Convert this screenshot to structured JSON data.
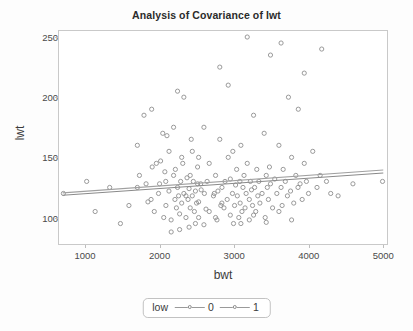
{
  "chart_data": {
    "type": "scatter",
    "title": "Analysis of Covariance of lwt",
    "xlabel": "bwt",
    "ylabel": "lwt",
    "xlim": [
      650,
      5050
    ],
    "ylim": [
      78,
      255
    ],
    "xticks": [
      1000,
      2000,
      3000,
      4000,
      5000
    ],
    "yticks": [
      100,
      150,
      200,
      250
    ],
    "grid": false,
    "legend": {
      "title": "low",
      "position": "bottom",
      "entries": [
        {
          "label": "0",
          "color": "#8d8d8d",
          "marker": "open-circle"
        },
        {
          "label": "1",
          "color": "#8d8d8d",
          "marker": "open-circle"
        }
      ]
    },
    "marker_style": {
      "shape": "open-circle",
      "radius": 2.1,
      "stroke": "#8f8f8f",
      "fill": "none"
    },
    "fit_lines": [
      {
        "name": "low = 0",
        "x": [
          700,
          5000
        ],
        "y": [
          118.5,
          137.0
        ],
        "color": "#8a8a8a"
      },
      {
        "name": "low = 1",
        "x": [
          700,
          5000
        ],
        "y": [
          120.5,
          139.5
        ],
        "color": "#a0a0a0"
      }
    ],
    "series": [
      {
        "name": "low = 0",
        "points": [
          [
            2523,
            113
          ],
          [
            2551,
            128
          ],
          [
            2557,
            123
          ],
          [
            2594,
            94
          ],
          [
            2600,
            120
          ],
          [
            2622,
            107
          ],
          [
            2637,
            130
          ],
          [
            2665,
            105
          ],
          [
            2722,
            118
          ],
          [
            2733,
            120
          ],
          [
            2750,
            135
          ],
          [
            2769,
            98
          ],
          [
            2782,
            122
          ],
          [
            2807,
            165
          ],
          [
            2821,
            110
          ],
          [
            2835,
            112
          ],
          [
            2836,
            125
          ],
          [
            2863,
            108
          ],
          [
            2877,
            130
          ],
          [
            2906,
            115
          ],
          [
            2920,
            150
          ],
          [
            2948,
            102
          ],
          [
            2948,
            132
          ],
          [
            2977,
            120
          ],
          [
            2982,
            155
          ],
          [
            2991,
            95
          ],
          [
            3005,
            110
          ],
          [
            3019,
            127
          ],
          [
            3033,
            140
          ],
          [
            3042,
            118
          ],
          [
            3062,
            100
          ],
          [
            3076,
            130
          ],
          [
            3080,
            112
          ],
          [
            3090,
            160
          ],
          [
            3104,
            105
          ],
          [
            3118,
            125
          ],
          [
            3132,
            135
          ],
          [
            3146,
            108
          ],
          [
            3160,
            120
          ],
          [
            3175,
            145
          ],
          [
            3203,
            115
          ],
          [
            3203,
            98
          ],
          [
            3217,
            130
          ],
          [
            3232,
            123
          ],
          [
            3246,
            110
          ],
          [
            3260,
            185
          ],
          [
            3274,
            125
          ],
          [
            3289,
            105
          ],
          [
            3303,
            140
          ],
          [
            3317,
            118
          ],
          [
            3331,
            130
          ],
          [
            3345,
            112
          ],
          [
            3374,
            120
          ],
          [
            3402,
            170
          ],
          [
            3416,
            100
          ],
          [
            3430,
            135
          ],
          [
            3444,
            125
          ],
          [
            3459,
            115
          ],
          [
            3473,
            142
          ],
          [
            3487,
            128
          ],
          [
            3515,
            108
          ],
          [
            3544,
            132
          ],
          [
            3572,
            120
          ],
          [
            3600,
            160
          ],
          [
            3629,
            125
          ],
          [
            3643,
            110
          ],
          [
            3657,
            140
          ],
          [
            3686,
            130
          ],
          [
            3714,
            118
          ],
          [
            3728,
            200
          ],
          [
            3756,
            122
          ],
          [
            3770,
            150
          ],
          [
            3799,
            112
          ],
          [
            3827,
            135
          ],
          [
            3856,
            125
          ],
          [
            3860,
            190
          ],
          [
            3884,
            128
          ],
          [
            3912,
            115
          ],
          [
            3940,
            145
          ],
          [
            3969,
            130
          ],
          [
            3997,
            120
          ],
          [
            4054,
            155
          ],
          [
            4111,
            125
          ],
          [
            4153,
            135
          ],
          [
            4174,
            240
          ],
          [
            4238,
            130
          ],
          [
            4295,
            120
          ],
          [
            4394,
            118
          ],
          [
            4593,
            128
          ],
          [
            4990,
            130
          ],
          [
            2523,
            150
          ],
          [
            2594,
            175
          ],
          [
            2665,
            145
          ],
          [
            2750,
            100
          ],
          [
            2920,
            210
          ],
          [
            3090,
            95
          ],
          [
            3260,
            102
          ],
          [
            3430,
            96
          ],
          [
            3600,
            105
          ],
          [
            3770,
            98
          ],
          [
            2807,
            225
          ],
          [
            3175,
            250
          ],
          [
            3487,
            235
          ],
          [
            3940,
            220
          ],
          [
            3629,
            245
          ]
        ]
      },
      {
        "name": "low = 1",
        "points": [
          [
            709,
            120
          ],
          [
            1021,
            130
          ],
          [
            1135,
            105
          ],
          [
            1330,
            125
          ],
          [
            1474,
            95
          ],
          [
            1588,
            110
          ],
          [
            1701,
            160
          ],
          [
            1729,
            135
          ],
          [
            1790,
            185
          ],
          [
            1818,
            128
          ],
          [
            1885,
            115
          ],
          [
            1893,
            190
          ],
          [
            1928,
            105
          ],
          [
            1985,
            120
          ],
          [
            2013,
            147
          ],
          [
            2055,
            100
          ],
          [
            2082,
            130
          ],
          [
            2084,
            110
          ],
          [
            2125,
            122
          ],
          [
            2126,
            155
          ],
          [
            2154,
            98
          ],
          [
            2187,
            135
          ],
          [
            2205,
            115
          ],
          [
            2211,
            140
          ],
          [
            2225,
            108
          ],
          [
            2240,
            125
          ],
          [
            2254,
            118
          ],
          [
            2268,
            103
          ],
          [
            2282,
            130
          ],
          [
            2296,
            112
          ],
          [
            2310,
            145
          ],
          [
            2325,
            120
          ],
          [
            2353,
            100
          ],
          [
            2367,
            133
          ],
          [
            2381,
            115
          ],
          [
            2395,
            124
          ],
          [
            2410,
            108
          ],
          [
            2424,
            165
          ],
          [
            2438,
            118
          ],
          [
            2452,
            130
          ],
          [
            2466,
            105
          ],
          [
            2480,
            122
          ],
          [
            2495,
            112
          ],
          [
            2509,
            128
          ],
          [
            2523,
            100
          ],
          [
            2187,
            175
          ],
          [
            2325,
            200
          ],
          [
            2438,
            155
          ],
          [
            2098,
            168
          ],
          [
            1956,
            145
          ],
          [
            2268,
            90
          ],
          [
            2395,
            92
          ],
          [
            2155,
            88
          ],
          [
            2480,
            95
          ],
          [
            2042,
            170
          ],
          [
            1701,
            125
          ],
          [
            1843,
            113
          ],
          [
            1900,
            142
          ],
          [
            2240,
            205
          ],
          [
            2353,
            118
          ],
          [
            2070,
            138
          ],
          [
            2296,
            150
          ],
          [
            2410,
            135
          ],
          [
            2509,
            142
          ],
          [
            1999,
            128
          ]
        ]
      }
    ]
  }
}
